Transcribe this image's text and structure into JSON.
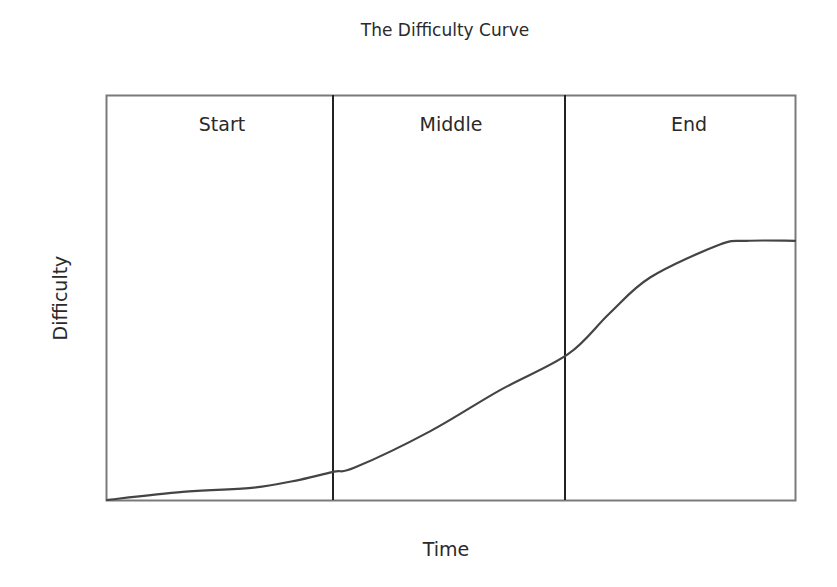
{
  "chart_data": {
    "type": "line",
    "title": "The Difficulty Curve",
    "xlabel": "Time",
    "ylabel": "Difficulty",
    "grid": false,
    "legend": null,
    "sections": [
      {
        "label": "Start",
        "x_range": [
          0,
          0.33
        ]
      },
      {
        "label": "Middle",
        "x_range": [
          0.33,
          0.67
        ]
      },
      {
        "label": "End",
        "x_range": [
          0.67,
          1.0
        ]
      }
    ],
    "series": [
      {
        "name": "Difficulty",
        "x": [
          0.0,
          0.11,
          0.21,
          0.28,
          0.33,
          0.36,
          0.47,
          0.57,
          0.67,
          0.73,
          0.79,
          0.89,
          0.93,
          1.0
        ],
        "values": [
          0.0,
          0.02,
          0.03,
          0.05,
          0.07,
          0.08,
          0.17,
          0.27,
          0.36,
          0.46,
          0.55,
          0.63,
          0.64,
          0.64
        ]
      }
    ],
    "xlim": [
      0,
      1
    ],
    "ylim": [
      0,
      1
    ]
  },
  "labels": {
    "title": "The Difficulty Curve",
    "section_start": "Start",
    "section_middle": "Middle",
    "section_end": "End",
    "x_axis": "Time",
    "y_axis": "Difficulty"
  },
  "colors": {
    "frame": "#7a7a7a",
    "divider": "#222222",
    "curve": "#444444"
  }
}
